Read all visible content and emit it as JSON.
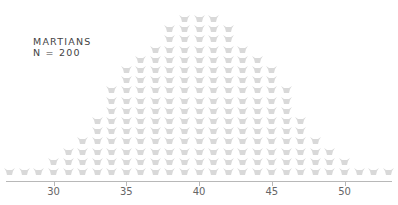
{
  "chart_data": {
    "type": "isotype-histogram",
    "title": "MARTIANS",
    "subtitle": "N = 200",
    "xlabel": "",
    "ylabel": "",
    "x_ticks": [
      30,
      35,
      40,
      45,
      50
    ],
    "xlim": [
      26.5,
      53.5
    ],
    "grid": false,
    "icon": "martian-head-icon",
    "icon_color": "#d9d9d9",
    "axis_color": "#b8b8b8",
    "x": [
      27,
      28,
      29,
      30,
      31,
      32,
      33,
      34,
      35,
      36,
      37,
      38,
      39,
      40,
      41,
      42,
      43,
      44,
      45,
      46,
      47,
      48,
      49,
      50,
      51,
      52,
      53
    ],
    "counts": [
      1,
      1,
      1,
      2,
      3,
      4,
      6,
      9,
      11,
      12,
      13,
      15,
      16,
      16,
      16,
      15,
      13,
      12,
      11,
      9,
      6,
      4,
      3,
      2,
      1,
      1,
      1
    ]
  },
  "labels": {
    "title": "MARTIANS",
    "subtitle": "N = 200"
  }
}
